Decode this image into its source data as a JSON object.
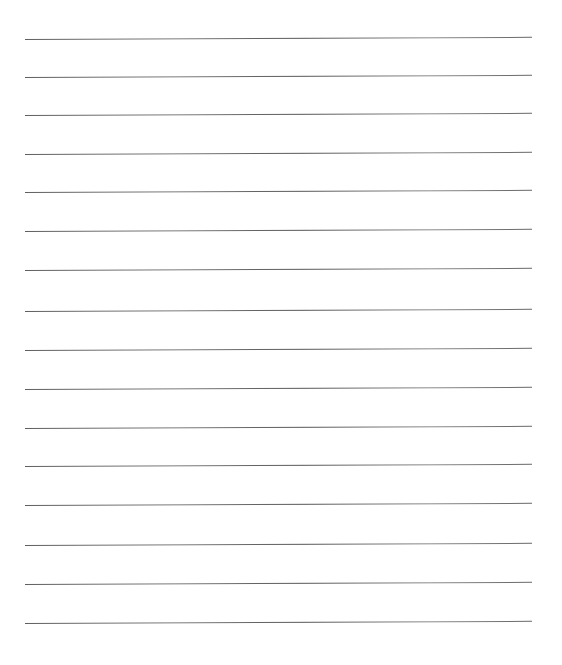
{
  "page": {
    "type": "lined-paper",
    "background_color": "#ffffff",
    "line_color": "#666666",
    "top_text_fragment": "",
    "rules": [
      {
        "index": 1,
        "y": 39
      },
      {
        "index": 2,
        "y": 77
      },
      {
        "index": 3,
        "y": 115
      },
      {
        "index": 4,
        "y": 154
      },
      {
        "index": 5,
        "y": 192
      },
      {
        "index": 6,
        "y": 231
      },
      {
        "index": 7,
        "y": 270
      },
      {
        "index": 8,
        "y": 311
      },
      {
        "index": 9,
        "y": 350
      },
      {
        "index": 10,
        "y": 389
      },
      {
        "index": 11,
        "y": 428
      },
      {
        "index": 12,
        "y": 466
      },
      {
        "index": 13,
        "y": 505
      },
      {
        "index": 14,
        "y": 545
      },
      {
        "index": 15,
        "y": 584
      },
      {
        "index": 16,
        "y": 623
      }
    ],
    "rule_left": 25,
    "rule_right": 532
  }
}
